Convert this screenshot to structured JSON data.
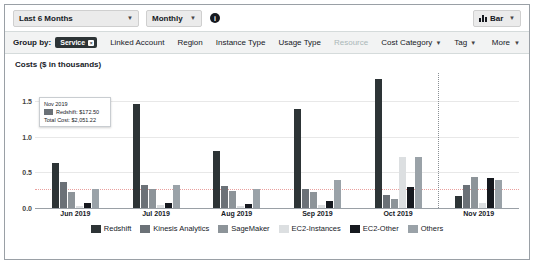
{
  "toolbar": {
    "date_range": "Last 6 Months",
    "granularity": "Monthly",
    "info_icon": "info-icon",
    "chart_type": "Bar",
    "chart_type_icon": "bar-chart-icon",
    "caret": "▼"
  },
  "group_by": {
    "label": "Group by:",
    "selected_pill": "Service",
    "pill_close": "×",
    "dimensions": [
      {
        "label": "Linked Account",
        "dropdown": false,
        "disabled": false
      },
      {
        "label": "Region",
        "dropdown": false,
        "disabled": false
      },
      {
        "label": "Instance Type",
        "dropdown": false,
        "disabled": false
      },
      {
        "label": "Usage Type",
        "dropdown": false,
        "disabled": false
      },
      {
        "label": "Resource",
        "dropdown": false,
        "disabled": true
      },
      {
        "label": "Cost Category",
        "dropdown": true,
        "disabled": false
      },
      {
        "label": "Tag",
        "dropdown": true,
        "disabled": false
      }
    ],
    "more": "More"
  },
  "tooltip": {
    "date": "Nov 2019",
    "series_label": "Redshift: $172.50",
    "series_color": "#6b7177",
    "total": "Total Cost: $2,051.22"
  },
  "chart_data": {
    "type": "bar",
    "title": "Costs ($ in thousands)",
    "xlabel": "",
    "ylabel": "Costs ($ in thousands)",
    "categories": [
      "Jun 2019",
      "Jul 2019",
      "Aug 2019",
      "Sep 2019",
      "Oct 2019",
      "Nov 2019"
    ],
    "yticks": [
      "0.0",
      "0.5",
      "1.0",
      "1.5"
    ],
    "ytick_values": [
      0.0,
      0.5,
      1.0,
      1.5
    ],
    "ylim": [
      0,
      1.9
    ],
    "grid": true,
    "legend_position": "bottom",
    "annotations": {
      "threshold_line_value": 0.27,
      "forecast_divider_after": "Oct 2019"
    },
    "series": [
      {
        "name": "Redshift",
        "color": "#2d3436",
        "values": [
          0.63,
          1.47,
          0.8,
          1.4,
          1.82,
          0.17
        ]
      },
      {
        "name": "Kinesis Analytics",
        "color": "#6b7177",
        "values": [
          0.37,
          0.33,
          0.31,
          0.27,
          0.18,
          0.33
        ]
      },
      {
        "name": "SageMaker",
        "color": "#8d9499",
        "values": [
          0.22,
          0.27,
          0.24,
          0.22,
          0.12,
          0.44
        ]
      },
      {
        "name": "EC2-Instances",
        "color": "#dcdfe1",
        "values": [
          0.03,
          0.04,
          0.03,
          0.04,
          0.72,
          0.07
        ]
      },
      {
        "name": "EC2-Other",
        "color": "#16191f",
        "values": [
          0.07,
          0.07,
          0.06,
          0.1,
          0.3,
          0.42
        ]
      },
      {
        "name": "Others",
        "color": "#9aa2a8",
        "values": [
          0.27,
          0.32,
          0.27,
          0.39,
          0.72,
          0.4
        ]
      }
    ]
  }
}
